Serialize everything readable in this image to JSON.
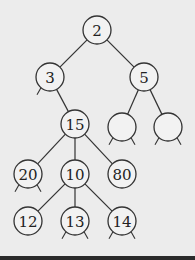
{
  "diagram": {
    "type": "tree",
    "nodes": [
      {
        "id": "n2",
        "label": "2",
        "x": 97,
        "y": 30
      },
      {
        "id": "n3",
        "label": "3",
        "x": 50,
        "y": 77
      },
      {
        "id": "n5",
        "label": "5",
        "x": 144,
        "y": 77
      },
      {
        "id": "n15",
        "label": "15",
        "x": 75,
        "y": 124
      },
      {
        "id": "e1",
        "label": "",
        "x": 122,
        "y": 127
      },
      {
        "id": "e2",
        "label": "",
        "x": 168,
        "y": 127
      },
      {
        "id": "n20",
        "label": "20",
        "x": 28,
        "y": 174
      },
      {
        "id": "n10",
        "label": "10",
        "x": 75,
        "y": 174
      },
      {
        "id": "n80",
        "label": "80",
        "x": 122,
        "y": 174
      },
      {
        "id": "n12",
        "label": "12",
        "x": 28,
        "y": 221
      },
      {
        "id": "n13",
        "label": "13",
        "x": 75,
        "y": 221
      },
      {
        "id": "n14",
        "label": "14",
        "x": 122,
        "y": 221
      }
    ],
    "edges": [
      [
        "n2",
        "n3"
      ],
      [
        "n2",
        "n5"
      ],
      [
        "n3",
        "n15"
      ],
      [
        "n5",
        "e1"
      ],
      [
        "n5",
        "e2"
      ],
      [
        "n15",
        "n20"
      ],
      [
        "n15",
        "n10"
      ],
      [
        "n15",
        "n80"
      ],
      [
        "n10",
        "n12"
      ],
      [
        "n10",
        "n13"
      ],
      [
        "n10",
        "n14"
      ]
    ],
    "stubs": {
      "n3": [
        "left"
      ],
      "e1": [
        "left",
        "right"
      ],
      "e2": [
        "left",
        "right"
      ],
      "n20": [
        "left",
        "right"
      ],
      "n13": [
        "left",
        "right"
      ],
      "n14": [
        "left",
        "right"
      ]
    }
  }
}
